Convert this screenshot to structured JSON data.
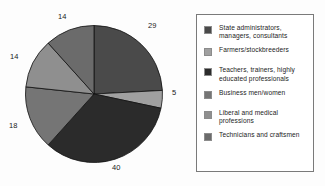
{
  "chart_data": {
    "type": "pie",
    "title": "",
    "labels": [
      "State administrators, managers, consultants",
      "Farmers/stockbreeders",
      "Teachers, trainers, highly educated professionals",
      "Business men/women",
      "Liberal and medical professions",
      "Technicians and craftsmen"
    ],
    "values": [
      29,
      5,
      40,
      18,
      14,
      14
    ],
    "value_labels": [
      "29",
      "5",
      "40",
      "18",
      "14",
      "14"
    ],
    "colors": [
      "#4a4a4a",
      "#a0a0a0",
      "#2b2b2b",
      "#757575",
      "#8f8f8f",
      "#6b6b6b"
    ],
    "start_angle_deg": 0,
    "direction": "clockwise",
    "legend_position": "right",
    "grid": false
  },
  "legend": {
    "items": [
      {
        "label": "State administrators, managers, consultants",
        "color": "#4a4a4a"
      },
      {
        "label": "Farmers/stockbreeders",
        "color": "#a0a0a0"
      },
      {
        "label": "Teachers, trainers, highly educated professionals",
        "color": "#2b2b2b"
      },
      {
        "label": "Business men/women",
        "color": "#757575"
      },
      {
        "label": "Liberal and medical professions",
        "color": "#8f8f8f"
      },
      {
        "label": "Technicians and craftsmen",
        "color": "#6b6b6b"
      }
    ]
  },
  "pie_labels": {
    "top_left": "14",
    "top_right": "29",
    "right": "5",
    "bottom": "40",
    "left_lower": "18",
    "left_upper": "14"
  }
}
